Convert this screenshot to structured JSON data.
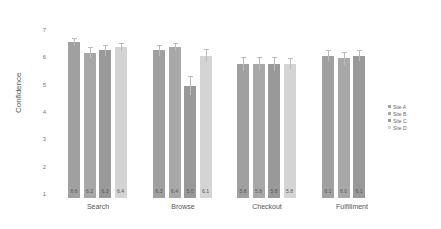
{
  "chart_data": {
    "type": "bar",
    "title": "",
    "xlabel": "",
    "ylabel": "Confidence",
    "ylim": [
      1,
      7
    ],
    "yticks": [
      1,
      2,
      3,
      4,
      5,
      6,
      7
    ],
    "grid": false,
    "legend_position": "right",
    "categories": [
      "Search",
      "Browse",
      "Checkout",
      "Fulfillment"
    ],
    "series": [
      {
        "name": "Site A",
        "color": "#a0a0a0",
        "values": [
          6.6,
          6.3,
          5.8,
          6.1
        ],
        "labels": [
          "6.6",
          "6.3",
          "5.8",
          "6.1"
        ]
      },
      {
        "name": "Site B",
        "color": "#a8a8a8",
        "values": [
          6.2,
          6.4,
          5.8,
          6.0
        ],
        "labels": [
          "6.2",
          "6.4",
          "5.8",
          "6.0"
        ]
      },
      {
        "name": "Site C",
        "color": "#999999",
        "values": [
          6.3,
          5.0,
          5.8,
          6.1
        ],
        "labels": [
          "6.3",
          "5.0",
          "5.8",
          "6.1"
        ]
      },
      {
        "name": "Site D",
        "color": "#d4d4d4",
        "values": [
          6.4,
          6.1,
          5.8,
          null
        ],
        "labels": [
          "6.4",
          "6.1",
          "5.8",
          ""
        ]
      }
    ],
    "error_bars": [
      [
        0.15,
        0.2,
        0.25,
        0.2
      ],
      [
        0.2,
        0.15,
        0.25,
        0.25
      ],
      [
        0.2,
        0.35,
        0.25,
        0.2
      ],
      [
        0.15,
        0.25,
        0.2,
        null
      ]
    ]
  }
}
